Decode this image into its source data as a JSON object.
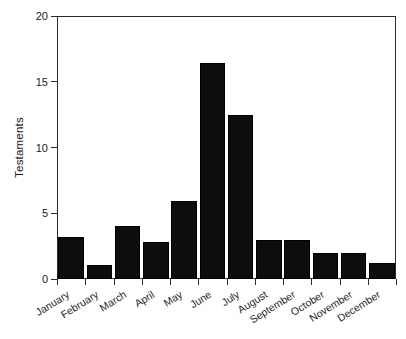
{
  "chart_data": {
    "type": "bar",
    "title": "",
    "xlabel": "",
    "ylabel": "Testaments",
    "categories": [
      "January",
      "February",
      "March",
      "April",
      "May",
      "June",
      "July",
      "August",
      "September",
      "October",
      "November",
      "December"
    ],
    "values": [
      3.2,
      1.1,
      4.0,
      2.8,
      5.9,
      16.4,
      12.5,
      3.0,
      3.0,
      2.0,
      2.0,
      1.2
    ],
    "ylim": [
      0,
      20
    ],
    "yticks": [
      0,
      5,
      10,
      15,
      20
    ],
    "ytick_labels": [
      "0",
      "5",
      "10",
      "15",
      "20"
    ],
    "grid": false,
    "legend": false,
    "bar_color": "#0d0d0d",
    "axis_color": "#2b2b2b",
    "background": "#ffffff"
  }
}
